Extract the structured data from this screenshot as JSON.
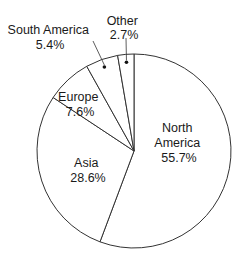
{
  "chart_data": {
    "type": "pie",
    "title": "",
    "start": "12 o'clock",
    "direction": "clockwise",
    "fill_color": "#ffffff",
    "stroke_color": "#333333",
    "slices": [
      {
        "label": "North America",
        "value": 55.7,
        "label_text": "55.7%",
        "label_lines": [
          "North",
          "America",
          "55.7%"
        ],
        "label_placement": "inside"
      },
      {
        "label": "Asia",
        "value": 28.6,
        "label_text": "28.6%",
        "label_lines": [
          "Asia",
          "28.6%"
        ],
        "label_placement": "inside"
      },
      {
        "label": "Europe",
        "value": 7.6,
        "label_text": "7.6%",
        "label_lines": [
          "Europe",
          "7.6%"
        ],
        "label_placement": "inside"
      },
      {
        "label": "South America",
        "value": 5.4,
        "label_text": "5.4%",
        "label_lines": [
          "South America",
          "5.4%"
        ],
        "label_placement": "outside-leader"
      },
      {
        "label": "Other",
        "value": 2.7,
        "label_text": "2.7%",
        "label_lines": [
          "Other",
          "2.7%"
        ],
        "label_placement": "outside-leader"
      }
    ]
  }
}
